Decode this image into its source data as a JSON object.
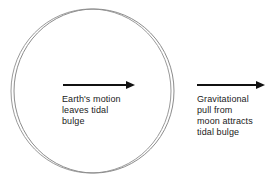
{
  "figure": {
    "background_color": "#ffffff"
  },
  "earth": {
    "label": "earth-circle",
    "outline_color": "#8c8c8c",
    "bulge_outline_color": "#9a9a9a",
    "center_x": 94,
    "center_y": 91,
    "radius_x": 80,
    "radius_y": 82,
    "bulge_offset_x": -3
  },
  "arrows": [
    {
      "id": "earth-motion-arrow",
      "color": "#111111",
      "x1": 63,
      "x2": 135,
      "y": 85
    },
    {
      "id": "moon-pull-arrow",
      "color": "#111111",
      "x1": 197,
      "x2": 265,
      "y": 85
    }
  ],
  "captions": {
    "left": "Earth's motion\nleaves tidal\nbulge",
    "right": "Gravitational\npull from\nmoon attracts\ntidal bulge"
  }
}
